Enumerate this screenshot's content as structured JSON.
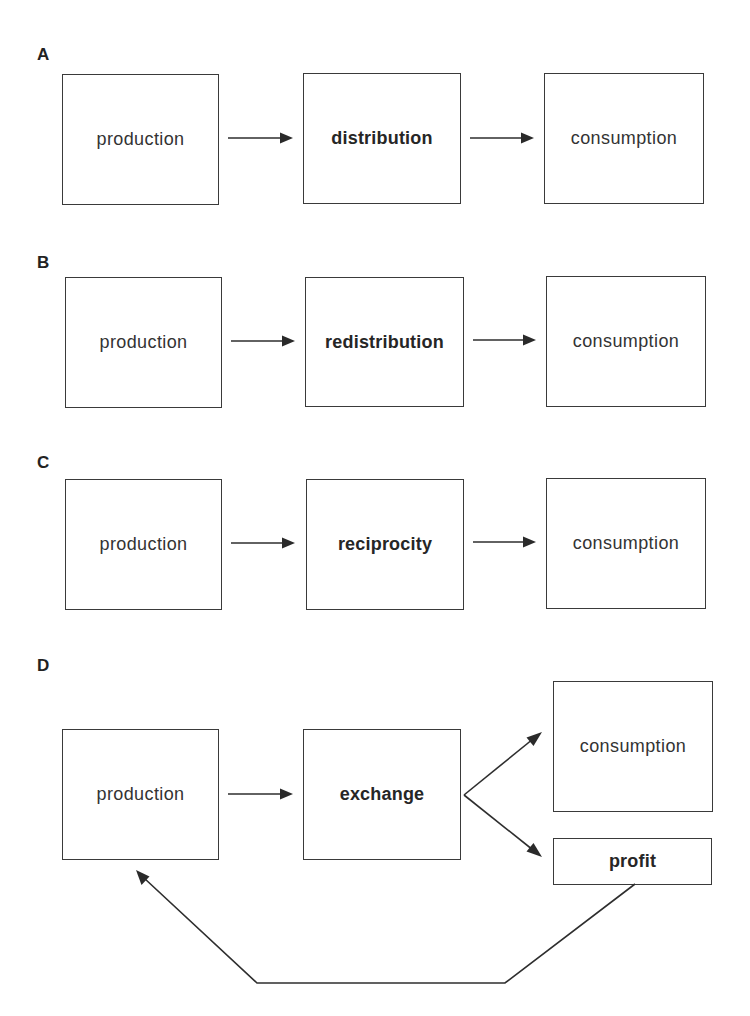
{
  "panels": {
    "A": {
      "label": "A",
      "boxes": [
        {
          "text": "production",
          "bold": false
        },
        {
          "text": "distribution",
          "bold": true
        },
        {
          "text": "consumption",
          "bold": false
        }
      ]
    },
    "B": {
      "label": "B",
      "boxes": [
        {
          "text": "production",
          "bold": false
        },
        {
          "text": "redistribution",
          "bold": true
        },
        {
          "text": "consumption",
          "bold": false
        }
      ]
    },
    "C": {
      "label": "C",
      "boxes": [
        {
          "text": "production",
          "bold": false
        },
        {
          "text": "reciprocity",
          "bold": true
        },
        {
          "text": "consumption",
          "bold": false
        }
      ]
    },
    "D": {
      "label": "D",
      "boxes": [
        {
          "text": "production",
          "bold": false
        },
        {
          "text": "exchange",
          "bold": true
        },
        {
          "text": "consumption",
          "bold": false
        },
        {
          "text": "profit",
          "bold": true
        }
      ]
    }
  },
  "edges": [
    {
      "panel": "A",
      "from": "production",
      "to": "distribution"
    },
    {
      "panel": "A",
      "from": "distribution",
      "to": "consumption"
    },
    {
      "panel": "B",
      "from": "production",
      "to": "redistribution"
    },
    {
      "panel": "B",
      "from": "redistribution",
      "to": "consumption"
    },
    {
      "panel": "C",
      "from": "production",
      "to": "reciprocity"
    },
    {
      "panel": "C",
      "from": "reciprocity",
      "to": "consumption"
    },
    {
      "panel": "D",
      "from": "production",
      "to": "exchange"
    },
    {
      "panel": "D",
      "from": "exchange",
      "to": "consumption"
    },
    {
      "panel": "D",
      "from": "exchange",
      "to": "profit"
    },
    {
      "panel": "D",
      "from": "profit",
      "to": "production"
    }
  ],
  "colors": {
    "stroke": "#2e2e2e",
    "text": "#333333",
    "background": "#ffffff"
  }
}
